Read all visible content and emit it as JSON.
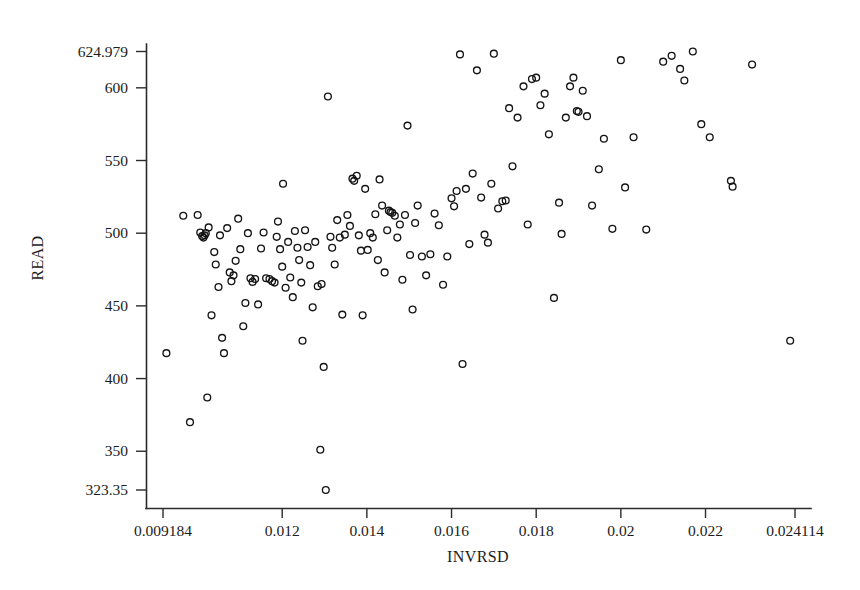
{
  "chart_data": {
    "type": "scatter",
    "title": "",
    "xlabel": "INVRSD",
    "ylabel": "READ",
    "xlim": [
      0.009184,
      0.024114
    ],
    "ylim": [
      323.35,
      624.979
    ],
    "grid": false,
    "legend": null,
    "marker": "open-circle",
    "xticks": [
      0.009184,
      0.012,
      0.014,
      0.016,
      0.018,
      0.02,
      0.022,
      0.024114
    ],
    "xtick_labels": [
      "0.009184",
      "0.012",
      "0.014",
      "0.016",
      "0.018",
      "0.02",
      "0.022",
      "0.024114"
    ],
    "yticks": [
      323.35,
      350,
      400,
      450,
      500,
      550,
      600,
      624.979
    ],
    "ytick_labels": [
      "323.35",
      "350",
      "400",
      "450",
      "500",
      "550",
      "600",
      "624.979"
    ],
    "points": [
      [
        0.009264,
        417.5
      ],
      [
        0.009663,
        512.0
      ],
      [
        0.009822,
        370.0
      ],
      [
        0.010003,
        512.5
      ],
      [
        0.010064,
        500.5
      ],
      [
        0.010109,
        498.0
      ],
      [
        0.01014,
        497.0
      ],
      [
        0.010168,
        498.5
      ],
      [
        0.010195,
        500.0
      ],
      [
        0.01023,
        387.0
      ],
      [
        0.010262,
        504.0
      ],
      [
        0.01033,
        443.5
      ],
      [
        0.010395,
        487.0
      ],
      [
        0.01043,
        478.5
      ],
      [
        0.010495,
        463.0
      ],
      [
        0.01053,
        498.5
      ],
      [
        0.01058,
        428.0
      ],
      [
        0.010625,
        417.5
      ],
      [
        0.0107,
        503.5
      ],
      [
        0.01076,
        473.0
      ],
      [
        0.0108,
        467.0
      ],
      [
        0.01085,
        471.0
      ],
      [
        0.0109,
        481.0
      ],
      [
        0.01096,
        510.0
      ],
      [
        0.01101,
        489.0
      ],
      [
        0.01108,
        436.0
      ],
      [
        0.01113,
        452.0
      ],
      [
        0.01119,
        500.0
      ],
      [
        0.01125,
        469.0
      ],
      [
        0.0113,
        466.5
      ],
      [
        0.01136,
        468.5
      ],
      [
        0.01143,
        451.0
      ],
      [
        0.0115,
        489.5
      ],
      [
        0.01156,
        500.5
      ],
      [
        0.01162,
        469.0
      ],
      [
        0.0117,
        468.5
      ],
      [
        0.01176,
        467.0
      ],
      [
        0.01182,
        466.0
      ],
      [
        0.01187,
        497.5
      ],
      [
        0.0119,
        508.0
      ],
      [
        0.01195,
        489.0
      ],
      [
        0.012,
        477.0
      ],
      [
        0.01202,
        534.0
      ],
      [
        0.01208,
        462.5
      ],
      [
        0.01214,
        494.0
      ],
      [
        0.01219,
        469.5
      ],
      [
        0.01225,
        456.0
      ],
      [
        0.0123,
        501.5
      ],
      [
        0.01236,
        490.0
      ],
      [
        0.0124,
        481.5
      ],
      [
        0.01245,
        466.0
      ],
      [
        0.01248,
        426.0
      ],
      [
        0.01254,
        502.0
      ],
      [
        0.0126,
        490.5
      ],
      [
        0.01266,
        478.0
      ],
      [
        0.01272,
        449.0
      ],
      [
        0.01278,
        494.0
      ],
      [
        0.01284,
        463.5
      ],
      [
        0.0129,
        351.0
      ],
      [
        0.01293,
        465.0
      ],
      [
        0.01298,
        408.0
      ],
      [
        0.01303,
        323.35
      ],
      [
        0.01308,
        594.0
      ],
      [
        0.01314,
        497.5
      ],
      [
        0.01318,
        490.0
      ],
      [
        0.01324,
        478.5
      ],
      [
        0.0133,
        509.0
      ],
      [
        0.01336,
        497.0
      ],
      [
        0.01342,
        444.0
      ],
      [
        0.01348,
        499.0
      ],
      [
        0.01354,
        512.5
      ],
      [
        0.0136,
        505.0
      ],
      [
        0.01366,
        537.5
      ],
      [
        0.0137,
        536.0
      ],
      [
        0.01376,
        539.5
      ],
      [
        0.01381,
        498.5
      ],
      [
        0.01386,
        488.0
      ],
      [
        0.0139,
        443.5
      ],
      [
        0.01396,
        530.5
      ],
      [
        0.01402,
        488.5
      ],
      [
        0.01408,
        500.0
      ],
      [
        0.01414,
        497.0
      ],
      [
        0.0142,
        513.0
      ],
      [
        0.01426,
        481.5
      ],
      [
        0.0143,
        537.0
      ],
      [
        0.01436,
        519.0
      ],
      [
        0.01442,
        473.0
      ],
      [
        0.01448,
        502.0
      ],
      [
        0.01452,
        515.5
      ],
      [
        0.01456,
        514.5
      ],
      [
        0.0146,
        514.0
      ],
      [
        0.01466,
        512.0
      ],
      [
        0.01472,
        497.0
      ],
      [
        0.01478,
        506.0
      ],
      [
        0.01484,
        468.0
      ],
      [
        0.0149,
        512.5
      ],
      [
        0.01496,
        574.0
      ],
      [
        0.01502,
        485.0
      ],
      [
        0.01508,
        447.5
      ],
      [
        0.01514,
        507.0
      ],
      [
        0.0152,
        519.0
      ],
      [
        0.0153,
        484.0
      ],
      [
        0.0154,
        471.0
      ],
      [
        0.0155,
        485.5
      ],
      [
        0.0156,
        513.5
      ],
      [
        0.0157,
        505.5
      ],
      [
        0.0158,
        464.5
      ],
      [
        0.0159,
        484.0
      ],
      [
        0.016,
        524.0
      ],
      [
        0.01606,
        518.5
      ],
      [
        0.01612,
        529.0
      ],
      [
        0.0162,
        623.0
      ],
      [
        0.01626,
        410.0
      ],
      [
        0.01634,
        530.5
      ],
      [
        0.01642,
        492.5
      ],
      [
        0.0165,
        541.0
      ],
      [
        0.0166,
        612.0
      ],
      [
        0.0167,
        524.5
      ],
      [
        0.01678,
        499.0
      ],
      [
        0.01686,
        493.5
      ],
      [
        0.01694,
        534.0
      ],
      [
        0.017,
        623.5
      ],
      [
        0.0171,
        517.0
      ],
      [
        0.0172,
        522.0
      ],
      [
        0.01728,
        522.5
      ],
      [
        0.01736,
        586.0
      ],
      [
        0.01744,
        546.0
      ],
      [
        0.01756,
        579.5
      ],
      [
        0.0177,
        601.0
      ],
      [
        0.0178,
        506.0
      ],
      [
        0.0179,
        606.0
      ],
      [
        0.018,
        607.0
      ],
      [
        0.0181,
        588.0
      ],
      [
        0.0182,
        596.0
      ],
      [
        0.0183,
        568.0
      ],
      [
        0.01842,
        455.5
      ],
      [
        0.01854,
        521.0
      ],
      [
        0.0186,
        499.5
      ],
      [
        0.0187,
        579.5
      ],
      [
        0.0188,
        601.0
      ],
      [
        0.01888,
        607.0
      ],
      [
        0.01896,
        584.0
      ],
      [
        0.019,
        583.5
      ],
      [
        0.0191,
        598.0
      ],
      [
        0.0192,
        580.5
      ],
      [
        0.01932,
        519.0
      ],
      [
        0.01948,
        544.0
      ],
      [
        0.0196,
        565.0
      ],
      [
        0.0198,
        503.0
      ],
      [
        0.02,
        619.0
      ],
      [
        0.0201,
        531.5
      ],
      [
        0.0203,
        566.0
      ],
      [
        0.0206,
        502.5
      ],
      [
        0.021,
        618.0
      ],
      [
        0.0212,
        622.0
      ],
      [
        0.0214,
        613.0
      ],
      [
        0.0215,
        605.0
      ],
      [
        0.0217,
        625.0
      ],
      [
        0.0219,
        575.0
      ],
      [
        0.0221,
        566.0
      ],
      [
        0.0226,
        536.0
      ],
      [
        0.02264,
        532.0
      ],
      [
        0.0231,
        616.0
      ],
      [
        0.024,
        426.0
      ]
    ]
  },
  "axes": {
    "x_axis_name": "x-axis",
    "y_axis_name": "y-axis"
  }
}
